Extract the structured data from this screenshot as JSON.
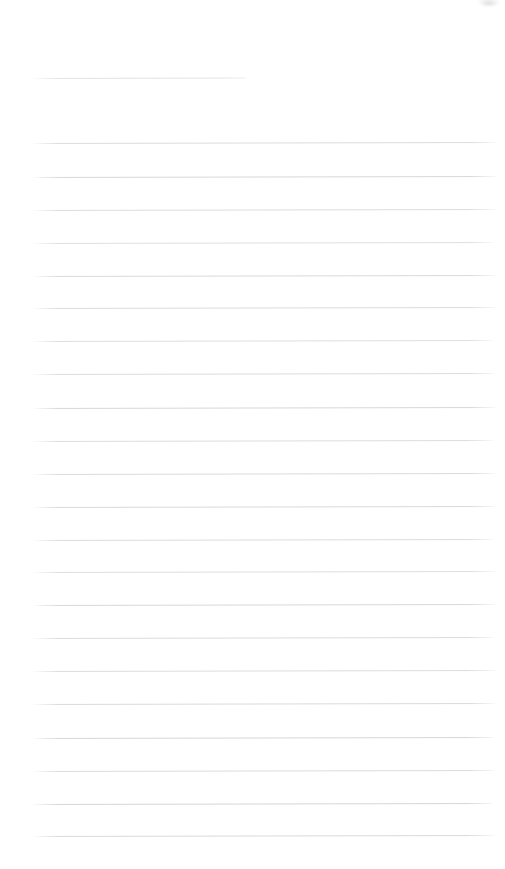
{
  "document": {
    "kind": "scanned-blank-lined-paper",
    "title": "",
    "body_text": "",
    "handwriting": "",
    "printed_text": "",
    "page_number": "",
    "width_px": 505,
    "height_px": 869
  },
  "colors": {
    "page_background": "#fefefe",
    "rule_line": "#cfcfd4",
    "header_rule_line": "#d2d2d7",
    "smudge": "#96969e"
  },
  "artifacts": [
    {
      "name": "top-right-scan-smudge",
      "x": 478,
      "y": -3,
      "width": 22,
      "height": 9
    }
  ],
  "ruling": {
    "left_x": 33,
    "right_x": 495,
    "spacing_px": 32.6,
    "stroke_px": 1,
    "slant_deg": -0.13,
    "header_rule": {
      "y": 78,
      "x_start": 33,
      "x_end": 246,
      "opacity": 0.62
    },
    "lines": [
      {
        "y": 143,
        "x_start": 33,
        "x_end": 496,
        "opacity": 0.72
      },
      {
        "y": 177,
        "x_start": 33,
        "x_end": 496,
        "opacity": 0.8
      },
      {
        "y": 210,
        "x_start": 33,
        "x_end": 495,
        "opacity": 0.7
      },
      {
        "y": 243,
        "x_start": 33,
        "x_end": 494,
        "opacity": 0.66
      },
      {
        "y": 276,
        "x_start": 33,
        "x_end": 495,
        "opacity": 0.78
      },
      {
        "y": 308,
        "x_start": 33,
        "x_end": 495,
        "opacity": 0.74
      },
      {
        "y": 341,
        "x_start": 33,
        "x_end": 494,
        "opacity": 0.68
      },
      {
        "y": 374,
        "x_start": 33,
        "x_end": 495,
        "opacity": 0.72
      },
      {
        "y": 408,
        "x_start": 33,
        "x_end": 495,
        "opacity": 0.82
      },
      {
        "y": 441,
        "x_start": 33,
        "x_end": 494,
        "opacity": 0.7
      },
      {
        "y": 474,
        "x_start": 33,
        "x_end": 495,
        "opacity": 0.76
      },
      {
        "y": 507,
        "x_start": 33,
        "x_end": 495,
        "opacity": 0.78
      },
      {
        "y": 540,
        "x_start": 33,
        "x_end": 494,
        "opacity": 0.72
      },
      {
        "y": 572,
        "x_start": 33,
        "x_end": 495,
        "opacity": 0.68
      },
      {
        "y": 605,
        "x_start": 33,
        "x_end": 495,
        "opacity": 0.8
      },
      {
        "y": 638,
        "x_start": 33,
        "x_end": 494,
        "opacity": 0.74
      },
      {
        "y": 671,
        "x_start": 33,
        "x_end": 495,
        "opacity": 0.7
      },
      {
        "y": 704,
        "x_start": 33,
        "x_end": 495,
        "opacity": 0.76
      },
      {
        "y": 738,
        "x_start": 33,
        "x_end": 494,
        "opacity": 0.84
      },
      {
        "y": 771,
        "x_start": 33,
        "x_end": 495,
        "opacity": 0.72
      },
      {
        "y": 804,
        "x_start": 33,
        "x_end": 493,
        "opacity": 0.86
      },
      {
        "y": 836,
        "x_start": 33,
        "x_end": 494,
        "opacity": 0.78
      }
    ]
  }
}
